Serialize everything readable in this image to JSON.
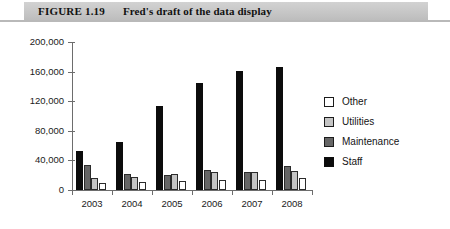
{
  "header": {
    "figure_number": "FIGURE 1.19",
    "title": "Fred's draft of the data display"
  },
  "chart_data": {
    "type": "bar",
    "title": "Fred's draft of the data display",
    "xlabel": "",
    "ylabel": "",
    "categories": [
      "2003",
      "2004",
      "2005",
      "2006",
      "2007",
      "2008"
    ],
    "ylim": [
      0,
      200000
    ],
    "yticks": [
      0,
      40000,
      80000,
      120000,
      160000,
      200000
    ],
    "ytick_labels": [
      "0",
      "40,000",
      "80,000",
      "120,000",
      "160,000",
      "200,000"
    ],
    "grid": false,
    "legend_position": "right",
    "bar_order_in_group": [
      "Staff",
      "Maintenance",
      "Utilities",
      "Other"
    ],
    "series": [
      {
        "name": "Other",
        "color": "#ffffff",
        "values": [
          9000,
          11000,
          12000,
          13000,
          14000,
          16000
        ]
      },
      {
        "name": "Utilities",
        "color": "#c4c4c4",
        "values": [
          16000,
          18000,
          22000,
          24000,
          25000,
          26000
        ]
      },
      {
        "name": "Maintenance",
        "color": "#666666",
        "values": [
          34000,
          22000,
          20000,
          27000,
          25000,
          33000
        ]
      },
      {
        "name": "Staff",
        "color": "#0c0c0c",
        "values": [
          53000,
          65000,
          113000,
          144000,
          161000,
          166000
        ]
      }
    ]
  },
  "legend": {
    "entries": [
      {
        "label": "Other",
        "swatch": "other"
      },
      {
        "label": "Utilities",
        "swatch": "util"
      },
      {
        "label": "Maintenance",
        "swatch": "maint"
      },
      {
        "label": "Staff",
        "swatch": "staff"
      }
    ]
  }
}
